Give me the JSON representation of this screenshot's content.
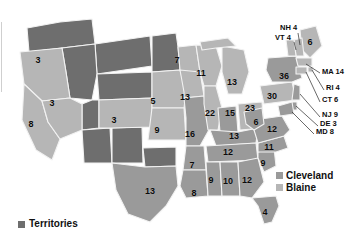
{
  "map": {
    "title_visible": false,
    "colors": {
      "cleveland": "#9a9a9a",
      "blaine": "#b6b6b6",
      "territories": "#6e6e6e",
      "border": "#f2f2f2",
      "background": "#ffffff",
      "label_text": "#0b0b0b"
    }
  },
  "legend": {
    "entries": [
      {
        "label": "Cleveland",
        "swatch": "#9a9a9a"
      },
      {
        "label": "Blaine",
        "swatch": "#b6b6b6"
      }
    ]
  },
  "territories_legend": {
    "label": "Territories",
    "swatch": "#6e6e6e"
  },
  "chart_data": {
    "type": "map",
    "legend_position": "right-middle",
    "series": [
      {
        "name": "Cleveland",
        "color": "#9a9a9a"
      },
      {
        "name": "Blaine",
        "color": "#b6b6b6"
      },
      {
        "name": "Territories",
        "color": "#6e6e6e"
      }
    ],
    "labels": [
      {
        "id": "OR",
        "text": "3",
        "value": 3,
        "x": 38,
        "y": 60,
        "party": "Blaine",
        "callout": false
      },
      {
        "id": "NV",
        "text": "3",
        "value": 3,
        "x": 52,
        "y": 103,
        "party": "Blaine",
        "callout": false
      },
      {
        "id": "CA",
        "text": "8",
        "value": 8,
        "x": 31,
        "y": 124,
        "party": "Blaine",
        "callout": false
      },
      {
        "id": "CO",
        "text": "3",
        "value": 3,
        "x": 114,
        "y": 120,
        "party": "Blaine",
        "callout": false
      },
      {
        "id": "NE",
        "text": "5",
        "value": 5,
        "x": 153,
        "y": 101,
        "party": "Blaine",
        "callout": false
      },
      {
        "id": "KS",
        "text": "9",
        "value": 9,
        "x": 157,
        "y": 130,
        "party": "Blaine",
        "callout": false
      },
      {
        "id": "TX",
        "text": "13",
        "value": 13,
        "x": 150,
        "y": 191,
        "party": "Cleveland",
        "callout": false
      },
      {
        "id": "MN",
        "text": "7",
        "value": 7,
        "x": 177,
        "y": 60,
        "party": "Blaine",
        "callout": false
      },
      {
        "id": "IA",
        "text": "13",
        "value": 13,
        "x": 185,
        "y": 97,
        "party": "Blaine",
        "callout": false
      },
      {
        "id": "WI",
        "text": "11",
        "value": 11,
        "x": 201,
        "y": 73,
        "party": "Blaine",
        "callout": false
      },
      {
        "id": "MI",
        "text": "13",
        "value": 13,
        "x": 232,
        "y": 82,
        "party": "Blaine",
        "callout": false
      },
      {
        "id": "MO",
        "text": "16",
        "value": 16,
        "x": 190,
        "y": 134,
        "party": "Cleveland",
        "callout": false
      },
      {
        "id": "IL",
        "text": "22",
        "value": 22,
        "x": 210,
        "y": 113,
        "party": "Blaine",
        "callout": false
      },
      {
        "id": "IN",
        "text": "15",
        "value": 15,
        "x": 230,
        "y": 113,
        "party": "Cleveland",
        "callout": false
      },
      {
        "id": "OH",
        "text": "23",
        "value": 23,
        "x": 250,
        "y": 108,
        "party": "Blaine",
        "callout": false
      },
      {
        "id": "KY",
        "text": "13",
        "value": 13,
        "x": 234,
        "y": 136,
        "party": "Cleveland",
        "callout": false
      },
      {
        "id": "TN",
        "text": "12",
        "value": 12,
        "x": 228,
        "y": 152,
        "party": "Cleveland",
        "callout": false
      },
      {
        "id": "AR",
        "text": "7",
        "value": 7,
        "x": 192,
        "y": 165,
        "party": "Cleveland",
        "callout": false
      },
      {
        "id": "LA",
        "text": "8",
        "value": 8,
        "x": 194,
        "y": 193,
        "party": "Cleveland",
        "callout": false
      },
      {
        "id": "MS",
        "text": "9",
        "value": 9,
        "x": 211,
        "y": 180,
        "party": "Cleveland",
        "callout": false
      },
      {
        "id": "AL",
        "text": "10",
        "value": 10,
        "x": 228,
        "y": 181,
        "party": "Cleveland",
        "callout": false
      },
      {
        "id": "GA",
        "text": "12",
        "value": 12,
        "x": 247,
        "y": 180,
        "party": "Cleveland",
        "callout": false
      },
      {
        "id": "FL",
        "text": "4",
        "value": 4,
        "x": 265,
        "y": 212,
        "party": "Cleveland",
        "callout": false
      },
      {
        "id": "SC",
        "text": "9",
        "value": 9,
        "x": 263,
        "y": 163,
        "party": "Cleveland",
        "callout": false
      },
      {
        "id": "NC",
        "text": "11",
        "value": 11,
        "x": 269,
        "y": 147,
        "party": "Cleveland",
        "callout": false
      },
      {
        "id": "VA",
        "text": "12",
        "value": 12,
        "x": 272,
        "y": 129,
        "party": "Cleveland",
        "callout": false
      },
      {
        "id": "WV",
        "text": "6",
        "value": 6,
        "x": 256,
        "y": 122,
        "party": "Cleveland",
        "callout": false
      },
      {
        "id": "PA",
        "text": "30",
        "value": 30,
        "x": 272,
        "y": 96,
        "party": "Blaine",
        "callout": false
      },
      {
        "id": "NY",
        "text": "36",
        "value": 36,
        "x": 284,
        "y": 76,
        "party": "Cleveland",
        "callout": false
      },
      {
        "id": "ME",
        "text": "6",
        "value": 6,
        "x": 310,
        "y": 42,
        "party": "Blaine",
        "callout": false
      },
      {
        "id": "NH",
        "text": "NH 4",
        "value": 4,
        "x": 280,
        "y": 28,
        "party": "Blaine",
        "callout": true
      },
      {
        "id": "VT",
        "text": "VT 4",
        "value": 4,
        "x": 275,
        "y": 38,
        "party": "Blaine",
        "callout": true
      },
      {
        "id": "MA",
        "text": "MA 14",
        "value": 14,
        "x": 322,
        "y": 72,
        "party": "Blaine",
        "callout": true
      },
      {
        "id": "RI",
        "text": "RI 4",
        "value": 4,
        "x": 326,
        "y": 88,
        "party": "Blaine",
        "callout": true
      },
      {
        "id": "CT",
        "text": "CT 6",
        "value": 6,
        "x": 322,
        "y": 100,
        "party": "Blaine",
        "callout": true
      },
      {
        "id": "NJ",
        "text": "NJ 9",
        "value": 9,
        "x": 322,
        "y": 115,
        "party": "Cleveland",
        "callout": true
      },
      {
        "id": "DE",
        "text": "DE 3",
        "value": 3,
        "x": 320,
        "y": 124,
        "party": "Cleveland",
        "callout": true
      },
      {
        "id": "MD",
        "text": "MD 8",
        "value": 8,
        "x": 316,
        "y": 132,
        "party": "Cleveland",
        "callout": true
      }
    ]
  }
}
